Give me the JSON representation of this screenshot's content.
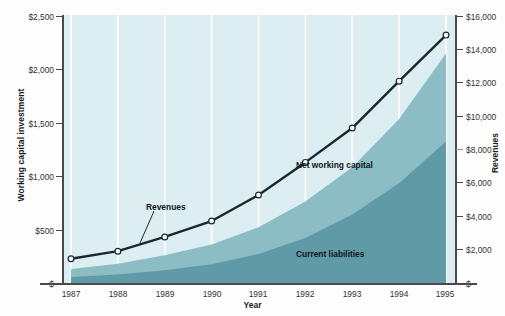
{
  "chart_data": {
    "type": "area",
    "title": "",
    "xlabel": "Year",
    "ylabel_left": "Working capital investment",
    "ylabel_right": "Revenues",
    "categories": [
      "1987",
      "1988",
      "1989",
      "1990",
      "1991",
      "1992",
      "1993",
      "1994",
      "1995"
    ],
    "ylim_left": [
      0,
      2500
    ],
    "ylim_right": [
      0,
      16000
    ],
    "ytick_labels_left": [
      "$",
      "$500",
      "$1,000",
      "$1,500",
      "$2,000",
      "$2,500"
    ],
    "ytick_values_left": [
      0,
      500,
      1000,
      1500,
      2000,
      2500
    ],
    "ytick_labels_right": [
      "$",
      "$2,000",
      "$4,000",
      "$6,000",
      "$8,000",
      "$10,000",
      "$12,000",
      "$14,000",
      "$16,000"
    ],
    "ytick_values_right": [
      0,
      2000,
      4000,
      6000,
      8000,
      10000,
      12000,
      14000,
      16000
    ],
    "grid": "vertical-white",
    "legend_position": "inline-annotations",
    "series": [
      {
        "name": "Revenues",
        "axis": "right",
        "type": "line",
        "marker": "open-circle",
        "color": "#1b2630",
        "values": [
          1450,
          1900,
          2750,
          3700,
          5250,
          7200,
          9250,
          12050,
          14800
        ]
      },
      {
        "name": "Net working capital",
        "axis": "left",
        "type": "area",
        "color": "#8cbcc4",
        "values": [
          130,
          180,
          260,
          360,
          520,
          760,
          1080,
          1530,
          2140
        ]
      },
      {
        "name": "Current liabilities",
        "axis": "left",
        "type": "area",
        "color": "#5f9aa6",
        "values": [
          55,
          80,
          120,
          175,
          270,
          420,
          640,
          930,
          1320
        ]
      }
    ],
    "annotations": [
      {
        "text": "Revenues",
        "x": 1989,
        "note": "leader line to revenue curve"
      },
      {
        "text": "Net working capital",
        "x": 1992,
        "note": "upper band label"
      },
      {
        "text": "Current liabilities",
        "x": 1993,
        "note": "lower band label"
      }
    ],
    "colors": {
      "plot_background": "#dceef2",
      "net_working_capital": "#8cbcc4",
      "current_liabilities": "#5f9aa6",
      "revenue_line": "#1b2630",
      "gridline": "#ffffff",
      "axis": "#2a2a2a"
    }
  },
  "axes": {
    "left_title": "Working capital investment",
    "right_title": "Revenues",
    "x_title": "Year"
  }
}
